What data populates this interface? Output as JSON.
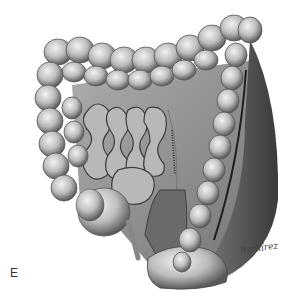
{
  "figure": {
    "style": "grayscale pencil drawing",
    "panel_label": "E",
    "signature": "Ramírez"
  },
  "colors": {
    "background": "#ffffff",
    "colon_light": "#d6d6d6",
    "colon_mid": "#9a9a9a",
    "colon_dark": "#4a4a4a",
    "mesentery": "#8c8c8c",
    "small_bowel": "#b5b5b5",
    "shadow": "#2a2a2a"
  }
}
